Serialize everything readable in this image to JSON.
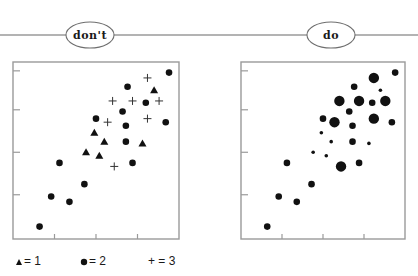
{
  "headers": {
    "left_label": "don't",
    "right_label": "do"
  },
  "legend": {
    "items": [
      {
        "symbol": "triangle",
        "label": "= 1"
      },
      {
        "symbol": "circle",
        "label": "= 2"
      },
      {
        "symbol": "plus",
        "label": "+ = 3"
      }
    ]
  },
  "colors": {
    "marker": "#111111",
    "axis": "#9a9a9a",
    "background": "#ffffff"
  },
  "chart_data": [
    {
      "type": "scatter",
      "title": "don't",
      "encoding": "marker shape encodes value (triangle=1, circle=2, plus=3)",
      "xlabel": "",
      "ylabel": "",
      "xlim": [
        0,
        100
      ],
      "ylim": [
        0,
        100
      ],
      "x_ticks": [
        25,
        50,
        75
      ],
      "y_ticks": [
        25,
        49,
        73,
        95
      ],
      "grid": false,
      "legend_position": "bottom",
      "points": [
        {
          "x": 94,
          "y": 94,
          "value": 2
        },
        {
          "x": 69,
          "y": 86,
          "value": 2
        },
        {
          "x": 80,
          "y": 77,
          "value": 2
        },
        {
          "x": 66,
          "y": 72,
          "value": 2
        },
        {
          "x": 50,
          "y": 68,
          "value": 2
        },
        {
          "x": 68,
          "y": 64,
          "value": 2
        },
        {
          "x": 92,
          "y": 66,
          "value": 2
        },
        {
          "x": 68,
          "y": 55,
          "value": 2
        },
        {
          "x": 28,
          "y": 43,
          "value": 2
        },
        {
          "x": 72,
          "y": 43,
          "value": 2
        },
        {
          "x": 43,
          "y": 31,
          "value": 2
        },
        {
          "x": 23,
          "y": 24,
          "value": 2
        },
        {
          "x": 34,
          "y": 21,
          "value": 2
        },
        {
          "x": 16,
          "y": 7,
          "value": 2
        },
        {
          "x": 85,
          "y": 84,
          "value": 1
        },
        {
          "x": 49,
          "y": 60,
          "value": 1
        },
        {
          "x": 55,
          "y": 55,
          "value": 1
        },
        {
          "x": 44,
          "y": 49,
          "value": 1
        },
        {
          "x": 78,
          "y": 54,
          "value": 1
        },
        {
          "x": 52,
          "y": 47,
          "value": 1
        },
        {
          "x": 81,
          "y": 91,
          "value": 3
        },
        {
          "x": 60,
          "y": 78,
          "value": 3
        },
        {
          "x": 72,
          "y": 78,
          "value": 3
        },
        {
          "x": 88,
          "y": 78,
          "value": 3
        },
        {
          "x": 57,
          "y": 66,
          "value": 3
        },
        {
          "x": 81,
          "y": 68,
          "value": 3
        },
        {
          "x": 61,
          "y": 41,
          "value": 3
        }
      ]
    },
    {
      "type": "scatter",
      "title": "do",
      "encoding": "marker size encodes value (small=1, medium=2, large=3)",
      "xlabel": "",
      "ylabel": "",
      "xlim": [
        0,
        100
      ],
      "ylim": [
        0,
        100
      ],
      "x_ticks": [
        25,
        50,
        75
      ],
      "y_ticks": [
        25,
        49,
        73,
        95
      ],
      "grid": false,
      "legend_position": "none",
      "points": [
        {
          "x": 94,
          "y": 94,
          "value": 2
        },
        {
          "x": 69,
          "y": 86,
          "value": 2
        },
        {
          "x": 80,
          "y": 77,
          "value": 2
        },
        {
          "x": 66,
          "y": 72,
          "value": 2
        },
        {
          "x": 50,
          "y": 68,
          "value": 2
        },
        {
          "x": 68,
          "y": 64,
          "value": 2
        },
        {
          "x": 92,
          "y": 66,
          "value": 2
        },
        {
          "x": 68,
          "y": 55,
          "value": 2
        },
        {
          "x": 28,
          "y": 43,
          "value": 2
        },
        {
          "x": 72,
          "y": 43,
          "value": 2
        },
        {
          "x": 43,
          "y": 31,
          "value": 2
        },
        {
          "x": 23,
          "y": 24,
          "value": 2
        },
        {
          "x": 34,
          "y": 21,
          "value": 2
        },
        {
          "x": 16,
          "y": 7,
          "value": 2
        },
        {
          "x": 85,
          "y": 84,
          "value": 1
        },
        {
          "x": 49,
          "y": 60,
          "value": 1
        },
        {
          "x": 55,
          "y": 55,
          "value": 1
        },
        {
          "x": 44,
          "y": 49,
          "value": 1
        },
        {
          "x": 78,
          "y": 54,
          "value": 1
        },
        {
          "x": 52,
          "y": 47,
          "value": 1
        },
        {
          "x": 81,
          "y": 91,
          "value": 3
        },
        {
          "x": 60,
          "y": 78,
          "value": 3
        },
        {
          "x": 72,
          "y": 78,
          "value": 3
        },
        {
          "x": 88,
          "y": 78,
          "value": 3
        },
        {
          "x": 57,
          "y": 66,
          "value": 3
        },
        {
          "x": 81,
          "y": 68,
          "value": 3
        },
        {
          "x": 61,
          "y": 41,
          "value": 3
        }
      ]
    }
  ]
}
